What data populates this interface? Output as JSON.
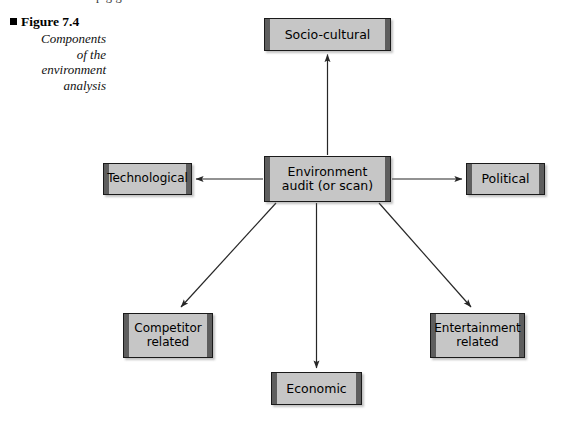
{
  "page": {
    "top_cropped_line": "p                    g  g                        n"
  },
  "caption": {
    "bullet_icon": "black-square-bullet",
    "figure_label": "Figure 7.4",
    "description_lines": [
      "Components",
      "of the",
      "environment",
      "analysis"
    ]
  },
  "diagram": {
    "type": "radial-hub-and-spoke",
    "center": {
      "id": "center",
      "label_lines": [
        "Environment",
        "audit (or scan)"
      ],
      "label": "Environment audit (or scan)"
    },
    "nodes": [
      {
        "id": "socio",
        "label": "Socio-cultural",
        "label_lines": [
          "Socio-cultural"
        ],
        "position": "top"
      },
      {
        "id": "technological",
        "label": "Technological",
        "label_lines": [
          "Technological"
        ],
        "position": "left"
      },
      {
        "id": "political",
        "label": "Political",
        "label_lines": [
          "Political"
        ],
        "position": "right"
      },
      {
        "id": "competitor",
        "label": "Competitor related",
        "label_lines": [
          "Competitor",
          "related"
        ],
        "position": "bottom-left"
      },
      {
        "id": "entertainment",
        "label": "Entertainment related",
        "label_lines": [
          "Entertainment",
          "related"
        ],
        "position": "bottom-right"
      },
      {
        "id": "economic",
        "label": "Economic",
        "label_lines": [
          "Economic"
        ],
        "position": "bottom"
      }
    ],
    "connectors": [
      {
        "from": "center",
        "to": "socio",
        "style": "single-arrow",
        "direction": "up"
      },
      {
        "from": "center",
        "to": "technological",
        "style": "single-arrow",
        "direction": "left"
      },
      {
        "from": "center",
        "to": "political",
        "style": "single-arrow",
        "direction": "right"
      },
      {
        "from": "center",
        "to": "competitor",
        "style": "single-arrow",
        "direction": "down-left"
      },
      {
        "from": "center",
        "to": "entertainment",
        "style": "single-arrow",
        "direction": "down-right"
      },
      {
        "from": "center",
        "to": "economic",
        "style": "single-arrow",
        "direction": "down"
      }
    ]
  },
  "colors": {
    "box_fill": "#c6c6c6",
    "box_bevel": "#5e5e5e",
    "box_border": "#1a1a1a",
    "line": "#262626",
    "page_background": "#ffffff",
    "text": "#000000"
  }
}
